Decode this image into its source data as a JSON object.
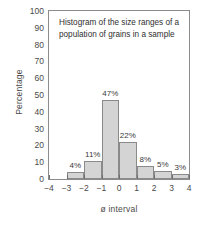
{
  "chart_data": {
    "type": "bar",
    "title_lines": [
      "Histogram of the size ranges of a",
      "population of grains in a sample"
    ],
    "xlabel": "ø interval",
    "ylabel": "Percentage",
    "xlim": [
      -4,
      4
    ],
    "ylim": [
      0,
      100
    ],
    "grid": false,
    "legend": null,
    "x_tick_labels": [
      "−4",
      "−3",
      "−2",
      "−1",
      "0",
      "1",
      "2",
      "3",
      "4"
    ],
    "x_ticks": [
      -4,
      -3,
      -2,
      -1,
      0,
      1,
      2,
      3,
      4
    ],
    "y_tick_labels": [
      "0",
      "10",
      "20",
      "30",
      "40",
      "50",
      "60",
      "70",
      "80",
      "90",
      "100"
    ],
    "y_ticks": [
      0,
      10,
      20,
      30,
      40,
      50,
      60,
      70,
      80,
      90,
      100
    ],
    "y_minor_ticks": [
      5,
      15,
      25,
      35,
      45,
      55,
      65,
      75,
      85,
      95
    ],
    "bin_edges": [
      -3,
      -2,
      -1,
      0,
      1,
      2,
      3,
      4
    ],
    "categories": [
      "−3 to −2",
      "−2 to −1",
      "−1 to 0",
      "0 to 1",
      "1 to 2",
      "2 to 3",
      "3 to 4"
    ],
    "values": [
      4,
      11,
      47,
      22,
      8,
      5,
      3
    ],
    "data_labels": [
      "4%",
      "11%",
      "47%",
      "22%",
      "8%",
      "5%",
      "3%"
    ],
    "bars": [
      {
        "x0": -3,
        "x1": -2,
        "value": 4,
        "label": "4%",
        "label_offset_y": 11
      },
      {
        "x0": -2,
        "x1": -1,
        "value": 11,
        "label": "11%",
        "label_offset_y": 11
      },
      {
        "x0": -1,
        "x1": 0,
        "value": 47,
        "label": "47%",
        "label_offset_y": 11
      },
      {
        "x0": 0,
        "x1": 1,
        "value": 22,
        "label": "22%",
        "label_offset_y": 11
      },
      {
        "x0": 1,
        "x1": 2,
        "value": 8,
        "label": "8%",
        "label_offset_y": 11
      },
      {
        "x0": 2,
        "x1": 3,
        "value": 5,
        "label": "5%",
        "label_offset_y": 11
      },
      {
        "x0": 3,
        "x1": 4,
        "value": 3,
        "label": "3%",
        "label_offset_y": 11
      }
    ],
    "colors": {
      "bar_fill": "#d4d4d4",
      "bar_edge": "#8a8a8a",
      "axis": "#8c8c8c",
      "text": "#3a3a3a",
      "background": "#ffffff"
    }
  }
}
